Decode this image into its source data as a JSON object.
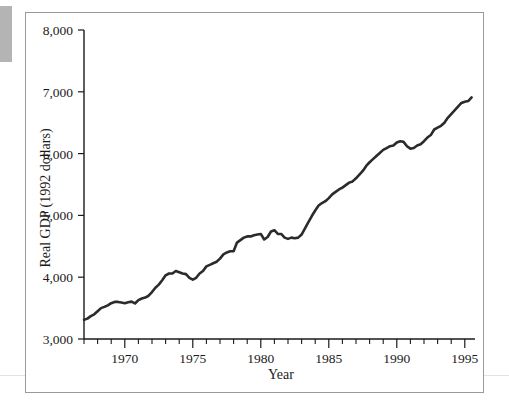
{
  "figure": {
    "background_color": "#ffffff",
    "frame_color": "#9a9a9a",
    "line_color": "#2b2b2b"
  },
  "chart_data": {
    "type": "line",
    "title": "",
    "xlabel": "Year",
    "ylabel": "Real GDP (1992 dollars)",
    "xlim": [
      1967.0,
      1995.75
    ],
    "ylim": [
      3000,
      8000
    ],
    "ytick_labels": [
      "3,000",
      "4,000",
      "5,000",
      "6,000",
      "7,000",
      "8,000"
    ],
    "ytick_values": [
      3000,
      4000,
      5000,
      6000,
      7000,
      8000
    ],
    "xtick_labels": [
      "1970",
      "1975",
      "1980",
      "1985",
      "1990",
      "1995"
    ],
    "xtick_values": [
      1970,
      1975,
      1980,
      1985,
      1990,
      1995
    ],
    "xtick_minor_interval": 1,
    "grid": false,
    "legend": null,
    "series": [
      {
        "name": "Real GDP (1992 dollars)",
        "color": "#2b2b2b",
        "x": [
          1967.0,
          1967.25,
          1967.5,
          1967.75,
          1968.0,
          1968.25,
          1968.5,
          1968.75,
          1969.0,
          1969.25,
          1969.5,
          1969.75,
          1970.0,
          1970.25,
          1970.5,
          1970.75,
          1971.0,
          1971.25,
          1971.5,
          1971.75,
          1972.0,
          1972.25,
          1972.5,
          1972.75,
          1973.0,
          1973.25,
          1973.5,
          1973.75,
          1974.0,
          1974.25,
          1974.5,
          1974.75,
          1975.0,
          1975.25,
          1975.5,
          1975.75,
          1976.0,
          1976.25,
          1976.5,
          1976.75,
          1977.0,
          1977.25,
          1977.5,
          1977.75,
          1978.0,
          1978.25,
          1978.5,
          1978.75,
          1979.0,
          1979.25,
          1979.5,
          1979.75,
          1980.0,
          1980.25,
          1980.5,
          1980.75,
          1981.0,
          1981.25,
          1981.5,
          1981.75,
          1982.0,
          1982.25,
          1982.5,
          1982.75,
          1983.0,
          1983.25,
          1983.5,
          1983.75,
          1984.0,
          1984.25,
          1984.5,
          1984.75,
          1985.0,
          1985.25,
          1985.5,
          1985.75,
          1986.0,
          1986.25,
          1986.5,
          1986.75,
          1987.0,
          1987.25,
          1987.5,
          1987.75,
          1988.0,
          1988.25,
          1988.5,
          1988.75,
          1989.0,
          1989.25,
          1989.5,
          1989.75,
          1990.0,
          1990.25,
          1990.5,
          1990.75,
          1991.0,
          1991.25,
          1991.5,
          1991.75,
          1992.0,
          1992.25,
          1992.5,
          1992.75,
          1993.0,
          1993.25,
          1993.5,
          1993.75,
          1994.0,
          1994.25,
          1994.5,
          1994.75,
          1995.0,
          1995.25,
          1995.5
        ],
        "y": [
          3310,
          3330,
          3370,
          3400,
          3450,
          3500,
          3520,
          3545,
          3580,
          3600,
          3600,
          3590,
          3580,
          3595,
          3605,
          3575,
          3630,
          3655,
          3670,
          3700,
          3760,
          3830,
          3880,
          3950,
          4030,
          4060,
          4060,
          4100,
          4080,
          4060,
          4050,
          3990,
          3960,
          3990,
          4060,
          4100,
          4175,
          4200,
          4225,
          4250,
          4300,
          4370,
          4400,
          4420,
          4420,
          4560,
          4600,
          4640,
          4660,
          4660,
          4680,
          4690,
          4700,
          4610,
          4650,
          4740,
          4760,
          4700,
          4700,
          4640,
          4620,
          4640,
          4630,
          4640,
          4690,
          4790,
          4890,
          4990,
          5080,
          5160,
          5200,
          5230,
          5280,
          5340,
          5380,
          5420,
          5450,
          5490,
          5530,
          5550,
          5600,
          5660,
          5720,
          5800,
          5860,
          5910,
          5960,
          6010,
          6060,
          6090,
          6120,
          6130,
          6180,
          6200,
          6190,
          6120,
          6080,
          6090,
          6130,
          6150,
          6200,
          6260,
          6300,
          6390,
          6420,
          6450,
          6500,
          6580,
          6640,
          6700,
          6760,
          6820,
          6840,
          6850,
          6910
        ]
      }
    ]
  },
  "axis_titles": {
    "x": "Year",
    "y": "Real GDP (1992 dollars)"
  }
}
